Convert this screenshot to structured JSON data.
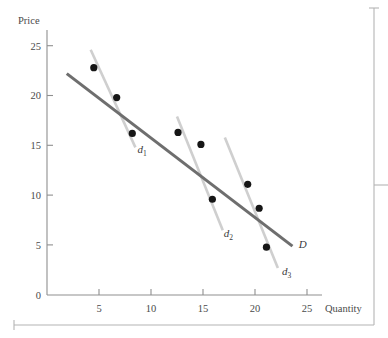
{
  "chart_data": {
    "type": "scatter",
    "title": "",
    "xlabel": "Quantity",
    "ylabel": "Price",
    "xlim": [
      0,
      27
    ],
    "ylim": [
      0,
      26.5
    ],
    "xticks": [
      0,
      5,
      10,
      15,
      20,
      25
    ],
    "yticks": [
      0,
      5,
      10,
      15,
      20,
      25
    ],
    "xtick_labels": [
      "0",
      "5",
      "10",
      "15",
      "20",
      "25"
    ],
    "ytick_labels": [
      "0",
      "5",
      "10",
      "15",
      "20",
      "25"
    ],
    "grid": false,
    "legend": "none",
    "points": [
      {
        "x": 4.5,
        "y": 22.8
      },
      {
        "x": 6.7,
        "y": 19.8
      },
      {
        "x": 8.2,
        "y": 16.2
      },
      {
        "x": 12.6,
        "y": 16.3
      },
      {
        "x": 14.8,
        "y": 15.1
      },
      {
        "x": 15.9,
        "y": 9.6
      },
      {
        "x": 19.3,
        "y": 11.1
      },
      {
        "x": 20.4,
        "y": 8.7
      },
      {
        "x": 21.1,
        "y": 4.8
      }
    ],
    "segments": [
      {
        "name": "d1",
        "label": "d",
        "subscript": "1",
        "x1": 4.2,
        "y1": 24.6,
        "x2": 8.5,
        "y2": 14.8,
        "label_x": 8.7,
        "label_y": 14.2,
        "color": "#cfcfcf"
      },
      {
        "name": "d2",
        "label": "d",
        "subscript": "2",
        "x1": 12.5,
        "y1": 17.9,
        "x2": 16.9,
        "y2": 6.5,
        "label_x": 17.0,
        "label_y": 5.8,
        "color": "#cfcfcf"
      },
      {
        "name": "d3",
        "label": "d",
        "subscript": "3",
        "x1": 17.1,
        "y1": 15.8,
        "x2": 22.2,
        "y2": 2.7,
        "label_x": 22.6,
        "label_y": 2.0,
        "color": "#cfcfcf"
      },
      {
        "name": "D",
        "label": "D",
        "subscript": "",
        "x1": 1.9,
        "y1": 22.2,
        "x2": 23.6,
        "y2": 4.9,
        "label_x": 24.2,
        "label_y": 4.7,
        "color": "#6e6e6e"
      }
    ],
    "annotations": [
      {
        "name": "d1-label",
        "text": "d1"
      },
      {
        "name": "d2-label",
        "text": "d2"
      },
      {
        "name": "d3-label",
        "text": "d3"
      },
      {
        "name": "D-label",
        "text": "D"
      }
    ]
  },
  "labels": {
    "y_axis_title": "Price",
    "x_axis_title": "Quantity",
    "demand_curve": "D",
    "segment_1": "d",
    "segment_1_sub": "1",
    "segment_2": "d",
    "segment_2_sub": "2",
    "segment_3": "d",
    "segment_3_sub": "3"
  },
  "ticks": {
    "y": [
      "25",
      "20",
      "15",
      "10",
      "5",
      "0"
    ],
    "x": [
      "5",
      "10",
      "15",
      "20",
      "25"
    ]
  },
  "colors": {
    "axis": "#8f8f8f",
    "border": "#b4b4b4",
    "segment": "#cfcfcf",
    "demand": "#6e6e6e",
    "point": "#161616",
    "text": "#4a4a4a",
    "background": "#ffffff"
  }
}
